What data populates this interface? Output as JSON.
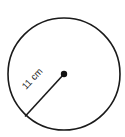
{
  "diagram": {
    "type": "circle",
    "radius_label": "11 cm",
    "stroke_color": "#1a1a1a",
    "background": "#ffffff"
  }
}
